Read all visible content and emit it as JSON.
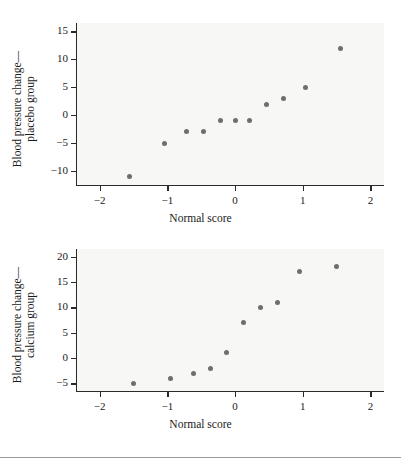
{
  "figure": {
    "background": "#ffffff",
    "plot_background": "#f7f7f6",
    "marker_color": "#6e6e6e",
    "axis_color": "#2a2a2a"
  },
  "chart_data": [
    {
      "type": "scatter",
      "id": "placebo-normal-quantile-plot",
      "title": "",
      "xlabel": "Normal score",
      "ylabel": "Blood pressure change—placebo group",
      "ylabel_line1": "Blood pressure change—",
      "ylabel_line2": "placebo group",
      "xlim": [
        -2.35,
        2.2
      ],
      "ylim": [
        -12.5,
        16.5
      ],
      "xticks": [
        -2,
        -1,
        0,
        1,
        2
      ],
      "xticklabels": [
        "−2",
        "−1",
        "0",
        "1",
        "2"
      ],
      "yticks": [
        -10,
        -5,
        0,
        5,
        10,
        15
      ],
      "yticklabels": [
        "−10",
        "−5",
        "0",
        "5",
        "10",
        "15"
      ],
      "grid": false,
      "legend": null,
      "x": [
        -1.56,
        -1.04,
        -0.72,
        -0.47,
        -0.22,
        0.0,
        0.22,
        0.47,
        0.72,
        1.04,
        1.56
      ],
      "y": [
        -11,
        -5,
        -3,
        -3,
        -1,
        -1,
        -1,
        2,
        3,
        5,
        12
      ]
    },
    {
      "type": "scatter",
      "id": "calcium-normal-quantile-plot",
      "title": "",
      "xlabel": "Normal score",
      "ylabel": "Blood pressure change—calcium group",
      "ylabel_line1": "Blood pressure change—",
      "ylabel_line2": "calcium group",
      "xlim": [
        -2.35,
        2.2
      ],
      "ylim": [
        -6.5,
        21.5
      ],
      "xticks": [
        -2,
        -1,
        0,
        1,
        2
      ],
      "xticklabels": [
        "−2",
        "−1",
        "0",
        "1",
        "2"
      ],
      "yticks": [
        -5,
        0,
        5,
        10,
        15,
        20
      ],
      "yticklabels": [
        "−5",
        "0",
        "5",
        "10",
        "15",
        "20"
      ],
      "grid": false,
      "legend": null,
      "x": [
        -1.5,
        -0.95,
        -0.62,
        -0.37,
        -0.12,
        0.12,
        0.37,
        0.62,
        0.95,
        1.5
      ],
      "y": [
        -5,
        -4,
        -3,
        -2,
        1,
        7,
        10,
        11,
        17,
        18
      ]
    }
  ]
}
